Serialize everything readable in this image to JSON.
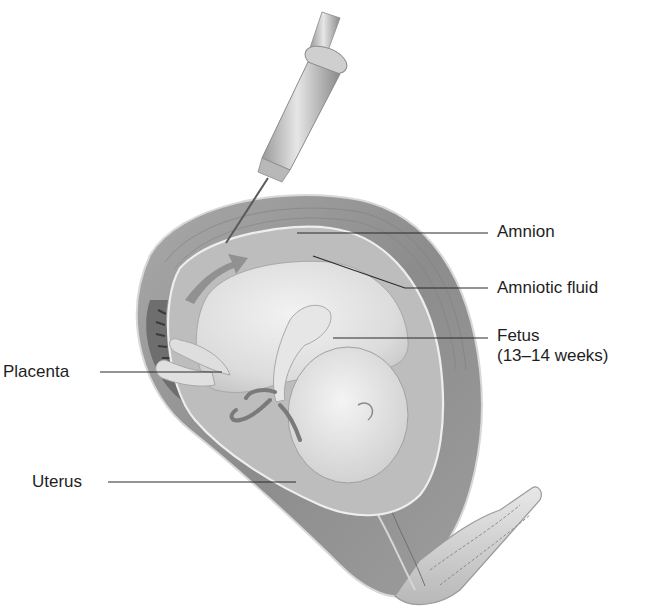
{
  "diagram": {
    "labels": {
      "amnion": "Amnion",
      "amniotic_fluid": "Amniotic fluid",
      "fetus": "Fetus",
      "fetus_age": "(13–14 weeks)",
      "placenta": "Placenta",
      "uterus": "Uterus"
    },
    "callouts": [
      {
        "id": "amnion",
        "text_x": 497,
        "text_y": 222,
        "line": [
          [
            297,
            233
          ],
          [
            488,
            233
          ]
        ]
      },
      {
        "id": "amniotic_fluid",
        "text_x": 497,
        "text_y": 278,
        "line": [
          [
            313,
            256
          ],
          [
            405,
            288
          ],
          [
            488,
            288
          ]
        ]
      },
      {
        "id": "fetus",
        "text_x": 497,
        "text_y": 325,
        "line": [
          [
            333,
            338
          ],
          [
            488,
            338
          ]
        ]
      },
      {
        "id": "placenta",
        "text_x": 3,
        "text_y": 362,
        "line": [
          [
            100,
            372
          ],
          [
            222,
            372
          ]
        ]
      },
      {
        "id": "uterus",
        "text_x": 32,
        "text_y": 472,
        "line": [
          [
            108,
            482
          ],
          [
            296,
            482
          ]
        ]
      }
    ],
    "colors": {
      "background": "#ffffff",
      "text": "#1e1e1e",
      "leader_line": "#2a2a2a",
      "uterine_wall": "#8f8f8f",
      "uterine_wall_light": "#b5b5b5",
      "amniotic_fluid": "#bdbdbd",
      "fetus": "#e2e2e2",
      "placenta": "#6e6e6e",
      "syringe": "#cfcfcf"
    }
  }
}
